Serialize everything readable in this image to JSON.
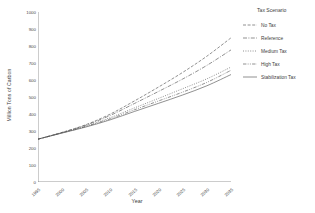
{
  "chart_data": {
    "type": "line",
    "title": "",
    "xlabel": "Year",
    "ylabel": "Million Tons of Carbon",
    "xlim": [
      1995,
      2035
    ],
    "ylim": [
      0,
      1000
    ],
    "grid": false,
    "legend_position": "right",
    "legend_title": "Tax Scenario",
    "xticks": [
      1995,
      2000,
      2005,
      2010,
      2015,
      2020,
      2025,
      2030,
      2035
    ],
    "xtick_labels": [
      "1995",
      "2000",
      "2005",
      "2010",
      "2015",
      "2020",
      "2025",
      "2030",
      "2035"
    ],
    "yticks": [
      0,
      100,
      200,
      300,
      400,
      500,
      600,
      700,
      800,
      900,
      1000
    ],
    "ytick_labels": [
      "0",
      "100",
      "200",
      "300",
      "400",
      "500",
      "600",
      "700",
      "800",
      "900",
      "1000"
    ],
    "x": [
      1995,
      2000,
      2005,
      2010,
      2015,
      2020,
      2025,
      2030,
      2035
    ],
    "series": [
      {
        "name": "No Tax",
        "style": "dashed-fine",
        "values": [
          252,
          292,
          338,
          400,
          477,
          559,
          645,
          740,
          848
        ]
      },
      {
        "name": "Reference",
        "style": "dash-dot",
        "values": [
          252,
          291,
          335,
          392,
          462,
          533,
          606,
          686,
          777
        ]
      },
      {
        "name": "Medium Tax",
        "style": "dotted-fine",
        "values": [
          252,
          290,
          330,
          379,
          436,
          492,
          549,
          607,
          676
        ]
      },
      {
        "name": "High Tax",
        "style": "dash-dot-dot",
        "values": [
          252,
          289,
          327,
          372,
          425,
          477,
          529,
          586,
          657
        ]
      },
      {
        "name": "Stabilization Tax",
        "style": "solid",
        "values": [
          252,
          288,
          324,
          366,
          415,
          463,
          512,
          566,
          632
        ]
      }
    ]
  },
  "legend": {
    "title": "Tax Scenario",
    "items": [
      {
        "label": "No Tax"
      },
      {
        "label": "Reference"
      },
      {
        "label": "Medium Tax"
      },
      {
        "label": "High Tax"
      },
      {
        "label": "Stabilization Tax"
      }
    ]
  },
  "axes": {
    "x_title": "Year",
    "y_title": "Million Tons of Carbon"
  }
}
